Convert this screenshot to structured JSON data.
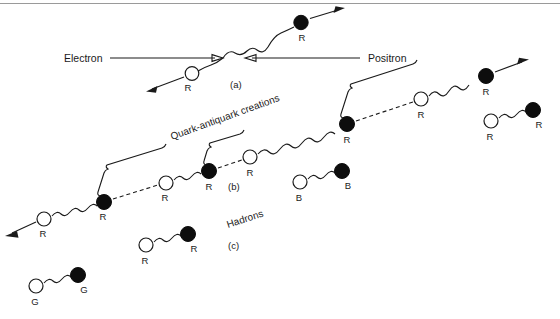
{
  "figure": {
    "title_labels": {
      "electron": "Electron",
      "positron": "Positron",
      "quark_antiquark": "Quark-antiquark creations",
      "hadrons": "Hadrons"
    },
    "panels": [
      {
        "id": "a",
        "label": "(a)"
      },
      {
        "id": "b",
        "label": "(b)"
      },
      {
        "id": "c",
        "label": "(c)"
      }
    ],
    "color_charges": {
      "red": "R",
      "blue": "B",
      "green": "G"
    },
    "colors": {
      "ink": "#1a1a1a",
      "fill_quark": "#0d0d0d",
      "open_quark": "#ffffff",
      "frame": "#9a9a9a",
      "background": "#ffffff"
    },
    "quark_labels": {
      "chain": [
        "R",
        "R",
        "R",
        "R",
        "R",
        "R",
        "R",
        "R"
      ],
      "top_pair": [
        "R",
        "R"
      ],
      "hadron_rr_right": [
        "R",
        "R"
      ],
      "hadron_bb": [
        "B",
        "B"
      ],
      "hadron_rr_mid": [
        "R",
        "R"
      ],
      "hadron_gg": [
        "G",
        "G"
      ]
    }
  }
}
